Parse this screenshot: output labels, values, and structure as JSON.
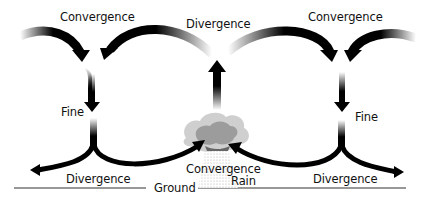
{
  "diagram": {
    "type": "atmospheric-circulation",
    "labels": {
      "convergence_top_left": "Convergence",
      "divergence_top_center": "Divergence",
      "convergence_top_right": "Convergence",
      "fine_left": "Fine",
      "fine_right": "Fine",
      "divergence_bottom_left": "Divergence",
      "divergence_bottom_right": "Divergence",
      "convergence_bottom_center": "Convergence",
      "rain": "Rain",
      "ground": "Ground"
    },
    "colors": {
      "arrow": "#000000",
      "cloud_outer": "#c8c8c8",
      "cloud_inner": "#9a9a9a",
      "ground_line": "#333333",
      "rain": "#bdbdbd"
    }
  }
}
